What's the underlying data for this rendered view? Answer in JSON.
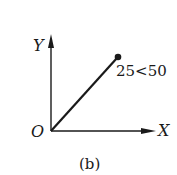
{
  "diagram": {
    "axes": {
      "y_label": "Y",
      "x_label": "X",
      "origin_label": "O"
    },
    "vector": {
      "label": "25<50",
      "magnitude": 25,
      "angle_deg": 50
    },
    "caption": "(b)",
    "colors": {
      "ink": "#1a1a1a",
      "background": "#ffffff"
    }
  }
}
